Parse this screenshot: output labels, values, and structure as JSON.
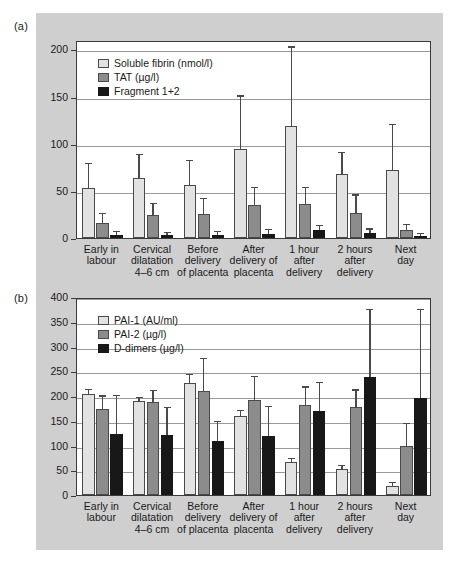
{
  "figure": {
    "panel_a_tag": "(a)",
    "panel_b_tag": "(b)",
    "background": "#cfcfcf",
    "series_colors": [
      "#e2e2e2",
      "#8c8c8c",
      "#181818"
    ]
  },
  "categories": [
    "Early in\nlabour",
    "Cervical\ndilatation\n4–6 cm",
    "Before\ndelivery\nof placenta",
    "After\ndelivery of\nplacenta",
    "1 hour\nafter\ndelivery",
    "2 hours\nafter\ndelivery",
    "Next\nday"
  ],
  "chart_data": [
    {
      "type": "bar",
      "panel": "(a)",
      "title": "",
      "xlabel": "",
      "ylabel": "",
      "ylim": [
        0,
        210
      ],
      "yticks": [
        0,
        50,
        100,
        150,
        200
      ],
      "grid": true,
      "legend_position": "top-left",
      "categories": [
        "Early in labour",
        "Cervical dilatation 4–6 cm",
        "Before delivery of placenta",
        "After delivery of placenta",
        "1 hour after delivery",
        "2 hours after delivery",
        "Next day"
      ],
      "series": [
        {
          "name": "Soluble fibrin (nmol/l)",
          "color": "#e2e2e2",
          "values": [
            53,
            64,
            56,
            94,
            119,
            68,
            72
          ],
          "errors_upper": [
            78,
            88,
            82,
            150,
            202,
            90,
            120
          ]
        },
        {
          "name": "TAT  (µg/l)",
          "color": "#8c8c8c",
          "values": [
            16,
            24,
            25,
            35,
            36,
            27,
            8
          ],
          "errors_upper": [
            25,
            36,
            41,
            53,
            53,
            45,
            14
          ]
        },
        {
          "name": "Fragment 1+2",
          "color": "#181818",
          "values": [
            3,
            3,
            3,
            4,
            8,
            5,
            2
          ],
          "errors_upper": [
            6,
            5,
            6,
            8,
            13,
            9,
            4
          ]
        }
      ]
    },
    {
      "type": "bar",
      "panel": "(b)",
      "title": "",
      "xlabel": "",
      "ylabel": "",
      "ylim": [
        0,
        400
      ],
      "yticks": [
        0,
        50,
        100,
        150,
        200,
        250,
        300,
        350,
        400
      ],
      "grid": true,
      "legend_position": "top-left",
      "categories": [
        "Early in labour",
        "Cervical dilatation 4–6 cm",
        "Before delivery of placenta",
        "After delivery of placenta",
        "1 hour after delivery",
        "2 hours after delivery",
        "Next day"
      ],
      "series": [
        {
          "name": "PAI-1 (AU/ml)",
          "color": "#e2e2e2",
          "values": [
            205,
            190,
            227,
            159,
            66,
            52,
            18
          ],
          "errors_upper": [
            212,
            195,
            242,
            169,
            72,
            58,
            24
          ]
        },
        {
          "name": "PAI-2 (µg/l)",
          "color": "#8c8c8c",
          "values": [
            173,
            188,
            210,
            191,
            181,
            178,
            99
          ],
          "errors_upper": [
            199,
            210,
            274,
            238,
            217,
            211,
            143
          ]
        },
        {
          "name": "D-dimers (µg/l)",
          "color": "#181818",
          "values": [
            124,
            121,
            109,
            119,
            170,
            239,
            197
          ],
          "errors_upper": [
            200,
            175,
            147,
            177,
            226,
            373,
            374
          ]
        }
      ]
    }
  ]
}
